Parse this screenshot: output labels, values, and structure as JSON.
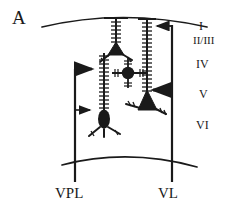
{
  "figure": {
    "panel_label": "A",
    "background_color": "#ffffff",
    "ink_color": "#1a1a1a"
  },
  "cortex": {
    "name": "cortical-slab",
    "pia_curve": "top boundary arc",
    "white_matter_curve": "bottom boundary arc",
    "layers": [
      {
        "id": "layer-I",
        "label": "I"
      },
      {
        "id": "layer-IIIII",
        "label": "II/III"
      },
      {
        "id": "layer-IV",
        "label": "IV"
      },
      {
        "id": "layer-V",
        "label": "V"
      },
      {
        "id": "layer-VI",
        "label": "VI"
      }
    ]
  },
  "afferents": [
    {
      "id": "vpl",
      "label": "VPL",
      "direction": "rightward",
      "arrow_count": 2,
      "target_layers": [
        "IV",
        "V"
      ]
    },
    {
      "id": "vl",
      "label": "VL",
      "direction": "leftward",
      "arrow_count": 2,
      "target_layers": [
        "I",
        "V"
      ]
    }
  ],
  "neurons": [
    {
      "id": "pyramidal-upper",
      "type": "pyramidal-neuron",
      "soma_shape": "triangle",
      "layer": "II/III",
      "dendrite": "spiny apical dendrite"
    },
    {
      "id": "stellate-cell",
      "type": "spiny-stellate-neuron",
      "soma_shape": "circle",
      "layer": "IV",
      "dendrite": "radiating spiny dendrites"
    },
    {
      "id": "pyramidal-lower-right",
      "type": "pyramidal-neuron",
      "soma_shape": "triangle",
      "layer": "V",
      "dendrite": "long spiny apical dendrite"
    },
    {
      "id": "pyramidal-lower-left",
      "type": "pyramidal-neuron",
      "soma_shape": "oval",
      "layer": "V",
      "dendrite": "long spiny apical dendrite"
    }
  ]
}
